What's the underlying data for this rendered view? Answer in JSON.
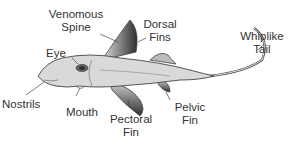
{
  "diagram": {
    "labels": {
      "venomous_spine": [
        "Venomous",
        "Spine"
      ],
      "dorsal_fins": [
        "Dorsal",
        "Fins"
      ],
      "whiplike_tail": [
        "Whiplike",
        "Tail"
      ],
      "eye": "Eye",
      "nostrils": "Nostrils",
      "mouth": "Mouth",
      "pectoral_fin": [
        "Pectoral",
        "Fin"
      ],
      "pelvic_fin": [
        "Pelvic",
        "Fin"
      ]
    },
    "colors": {
      "body": "#d9d9d9",
      "outline": "#444444",
      "fin_dark": "#3a3a3a",
      "text": "#333333"
    }
  }
}
